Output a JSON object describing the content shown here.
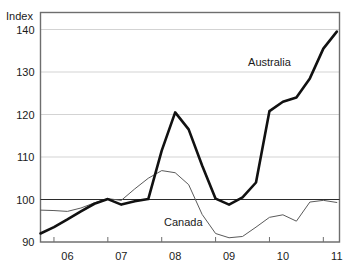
{
  "chart_data": {
    "type": "line",
    "title": "",
    "subtitle": "",
    "xlabel": "",
    "ylabel": "Index",
    "ylim": [
      90,
      144
    ],
    "xlim": [
      2005.75,
      2011.3
    ],
    "yticks": [
      90,
      100,
      110,
      120,
      130,
      140
    ],
    "ytick_labels": [
      "90",
      "100",
      "110",
      "120",
      "130",
      "140"
    ],
    "xticks": [
      2006.0,
      2007.0,
      2008.0,
      2009.0,
      2010.0,
      2011.0
    ],
    "xtick_labels": [
      "06",
      "07",
      "08",
      "09",
      "10",
      "11"
    ],
    "grid": true,
    "reference_line": 100,
    "legend_position": "inline-annotation",
    "x": [
      2005.75,
      2006.0,
      2006.25,
      2006.5,
      2006.75,
      2007.0,
      2007.25,
      2007.5,
      2007.75,
      2008.0,
      2008.25,
      2008.5,
      2008.75,
      2009.0,
      2009.25,
      2009.5,
      2009.75,
      2010.0,
      2010.25,
      2010.5,
      2010.75,
      2011.0,
      2011.25
    ],
    "series": [
      {
        "name": "Australia",
        "color": "#111111",
        "line_width": "thick",
        "values": [
          92.0,
          93.5,
          95.3,
          97.2,
          99.0,
          100.1,
          98.8,
          99.6,
          100.1,
          111.5,
          120.5,
          116.5,
          108.0,
          100.2,
          98.8,
          100.5,
          104.0,
          120.8,
          123.0,
          124.0,
          128.5,
          135.5,
          139.5
        ]
      },
      {
        "name": "Canada",
        "color": "#5a5a5a",
        "line_width": "thin",
        "values": [
          97.5,
          97.4,
          97.2,
          98.0,
          99.2,
          100.2,
          99.8,
          102.5,
          105.0,
          106.8,
          106.3,
          103.5,
          96.5,
          92.0,
          91.0,
          91.3,
          93.5,
          95.8,
          96.4,
          94.9,
          99.4,
          99.8,
          99.3
        ]
      }
    ],
    "annotations": [
      {
        "text": "Australia",
        "x": 2010.0,
        "y": 131.5
      },
      {
        "text": "Canada",
        "x": 2008.4,
        "y": 93.8
      }
    ]
  }
}
